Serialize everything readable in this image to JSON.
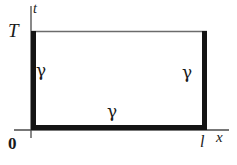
{
  "figure": {
    "kind": "math-diagram",
    "background_color": "#ffffff",
    "stroke_color": "#1a1a1a",
    "axis_color": "#4a4a4a",
    "top_edge_color": "#6b6b6b"
  },
  "axes": {
    "vertical": {
      "name": "t-axis",
      "label": "t"
    },
    "horizontal": {
      "name": "x-axis",
      "label": "x"
    },
    "origin": {
      "label": "0"
    }
  },
  "ticks": {
    "t_max": {
      "label": "T",
      "axis": "vertical"
    },
    "x_max": {
      "label": "l",
      "axis": "horizontal"
    }
  },
  "boundary_labels": {
    "left": "γ",
    "right": "γ",
    "bottom": "γ"
  },
  "geometry": {
    "rect_left": 31,
    "rect_right": 207,
    "rect_top": 31,
    "rect_bottom": 130,
    "thick_stroke_width": 5,
    "thin_stroke_width": 1.2,
    "axis_extension_top": 6,
    "axis_extension_bottom": 8,
    "axis_extension_left": 10,
    "axis_extension_right": 22
  }
}
